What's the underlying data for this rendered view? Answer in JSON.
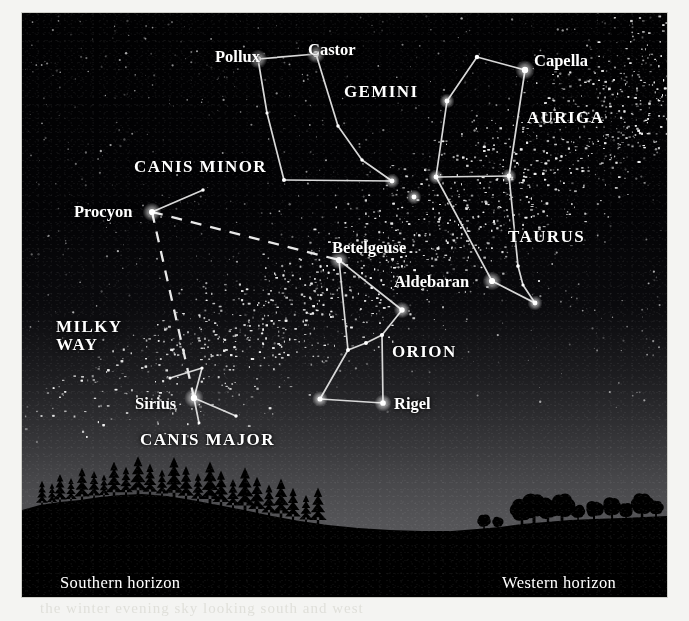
{
  "plate": {
    "width": 645,
    "height": 584,
    "sky_color_zenith": "#010102",
    "sky_color_horizon": "#5c5c5f",
    "star_color": "#ffffff",
    "line_color": "#d8d8d8",
    "ground_color": "#000000"
  },
  "bleed_through_text": "the winter evening sky looking south and west",
  "labels": {
    "stars": [
      {
        "name": "Pollux",
        "text": "Pollux",
        "x": 193,
        "y": 35,
        "anchor": "start"
      },
      {
        "name": "Castor",
        "text": "Castor",
        "x": 286,
        "y": 28,
        "anchor": "start"
      },
      {
        "name": "Capella",
        "text": "Capella",
        "x": 512,
        "y": 39,
        "anchor": "start"
      },
      {
        "name": "Procyon",
        "text": "Procyon",
        "x": 52,
        "y": 190,
        "anchor": "start"
      },
      {
        "name": "Betelgeuse",
        "text": "Betelgeuse",
        "x": 310,
        "y": 226,
        "anchor": "start"
      },
      {
        "name": "Aldebaran",
        "text": "Aldebaran",
        "x": 372,
        "y": 260,
        "anchor": "start"
      },
      {
        "name": "Rigel",
        "text": "Rigel",
        "x": 372,
        "y": 382,
        "anchor": "start"
      },
      {
        "name": "Sirius",
        "text": "Sirius",
        "x": 113,
        "y": 382,
        "anchor": "start"
      }
    ],
    "constellations": [
      {
        "name": "GEMINI",
        "text": "GEMINI",
        "x": 322,
        "y": 70,
        "lines": [
          "GEMINI"
        ]
      },
      {
        "name": "AURIGA",
        "text": "AURIGA",
        "x": 505,
        "y": 96,
        "lines": [
          "AURIGA"
        ]
      },
      {
        "name": "CANIS MINOR",
        "text": "CANIS MINOR",
        "x": 112,
        "y": 145,
        "lines": [
          "CANIS MINOR"
        ]
      },
      {
        "name": "TAURUS",
        "text": "TAURUS",
        "x": 486,
        "y": 215,
        "lines": [
          "TAURUS"
        ]
      },
      {
        "name": "ORION",
        "text": "ORION",
        "x": 370,
        "y": 330,
        "lines": [
          "ORION"
        ]
      },
      {
        "name": "CANIS MAJOR",
        "text": "CANIS MAJOR",
        "x": 118,
        "y": 418,
        "lines": [
          "CANIS MAJOR"
        ]
      },
      {
        "name": "MILKY WAY",
        "text": "MILKY\nWAY",
        "x": 34,
        "y": 305,
        "lines": [
          "MILKY",
          "WAY"
        ]
      }
    ],
    "horizons": [
      {
        "name": "southern-horizon",
        "text": "Southern horizon",
        "x": 38,
        "y": 561
      },
      {
        "name": "western-horizon",
        "text": "Western horizon",
        "x": 480,
        "y": 561
      }
    ]
  },
  "chart_data": {
    "type": "scatter",
    "coordinate_space": {
      "width": 645,
      "height": 584,
      "note": "plate pixel coordinates"
    },
    "constellations": [
      {
        "name": "GEMINI",
        "stars": [
          {
            "id": "pollux",
            "label": "Pollux",
            "x": 236,
            "y": 46,
            "mag_r": 5.0
          },
          {
            "id": "castor",
            "label": "Castor",
            "x": 294,
            "y": 41,
            "mag_r": 5.0
          },
          {
            "id": "gem-a",
            "label": "",
            "x": 245,
            "y": 100,
            "mag_r": 2.6
          },
          {
            "id": "gem-b",
            "label": "",
            "x": 262,
            "y": 167,
            "mag_r": 3.3
          },
          {
            "id": "gem-c",
            "label": "",
            "x": 316,
            "y": 113,
            "mag_r": 2.8
          },
          {
            "id": "gem-d",
            "label": "",
            "x": 340,
            "y": 147,
            "mag_r": 2.8
          },
          {
            "id": "gem-e",
            "label": "",
            "x": 370,
            "y": 168,
            "mag_r": 4.0
          }
        ],
        "lines": [
          [
            "pollux",
            "castor"
          ],
          [
            "pollux",
            "gem-a"
          ],
          [
            "gem-a",
            "gem-b"
          ],
          [
            "gem-b",
            "gem-e"
          ],
          [
            "castor",
            "gem-c"
          ],
          [
            "gem-c",
            "gem-d"
          ],
          [
            "gem-d",
            "gem-e"
          ]
        ]
      },
      {
        "name": "AURIGA",
        "stars": [
          {
            "id": "aur-top",
            "label": "",
            "x": 455,
            "y": 44,
            "mag_r": 3.6
          },
          {
            "id": "capella",
            "label": "Capella",
            "x": 503,
            "y": 57,
            "mag_r": 5.2
          },
          {
            "id": "aur-left",
            "label": "",
            "x": 425,
            "y": 88,
            "mag_r": 4.0
          },
          {
            "id": "aur-bl",
            "label": "",
            "x": 414,
            "y": 164,
            "mag_r": 4.0
          },
          {
            "id": "aur-br",
            "label": "",
            "x": 487,
            "y": 163,
            "mag_r": 4.0
          }
        ],
        "lines": [
          [
            "aur-top",
            "capella"
          ],
          [
            "aur-top",
            "aur-left"
          ],
          [
            "aur-left",
            "aur-bl"
          ],
          [
            "aur-bl",
            "aur-br"
          ],
          [
            "aur-br",
            "capella"
          ]
        ]
      },
      {
        "name": "TAURUS",
        "stars": [
          {
            "id": "tau-top",
            "label": "",
            "x": 392,
            "y": 184,
            "mag_r": 4.0
          },
          {
            "id": "aldebaran",
            "label": "Aldebaran",
            "x": 470,
            "y": 268,
            "mag_r": 5.0
          },
          {
            "id": "hya-a",
            "label": "",
            "x": 496,
            "y": 253,
            "mag_r": 3.0
          },
          {
            "id": "hya-b",
            "label": "",
            "x": 501,
            "y": 272,
            "mag_r": 2.6
          },
          {
            "id": "hya-c",
            "label": "",
            "x": 513,
            "y": 290,
            "mag_r": 4.0
          },
          {
            "id": "hya-d",
            "label": "",
            "x": 517,
            "y": 268,
            "mag_r": 1.8
          }
        ],
        "lines": [
          [
            "aur-bl",
            "aldebaran"
          ],
          [
            "aldebaran",
            "hya-c"
          ],
          [
            "aur-br",
            "hya-a"
          ],
          [
            "hya-a",
            "hya-b"
          ],
          [
            "hya-b",
            "hya-c"
          ]
        ]
      },
      {
        "name": "ORION",
        "stars": [
          {
            "id": "betelgeuse",
            "label": "Betelgeuse",
            "x": 317,
            "y": 247,
            "mag_r": 5.0
          },
          {
            "id": "bellatrix",
            "label": "",
            "x": 380,
            "y": 297,
            "mag_r": 4.4
          },
          {
            "id": "belt-1",
            "label": "",
            "x": 326,
            "y": 337,
            "mag_r": 3.2
          },
          {
            "id": "belt-2",
            "label": "",
            "x": 344,
            "y": 330,
            "mag_r": 3.2
          },
          {
            "id": "belt-3",
            "label": "",
            "x": 360,
            "y": 322,
            "mag_r": 3.4
          },
          {
            "id": "rigel",
            "label": "Rigel",
            "x": 361,
            "y": 390,
            "mag_r": 4.6
          },
          {
            "id": "saiph",
            "label": "",
            "x": 298,
            "y": 386,
            "mag_r": 4.2
          }
        ],
        "lines": [
          [
            "betelgeuse",
            "bellatrix"
          ],
          [
            "betelgeuse",
            "belt-1"
          ],
          [
            "bellatrix",
            "belt-3"
          ],
          [
            "belt-3",
            "belt-2"
          ],
          [
            "belt-2",
            "belt-1"
          ],
          [
            "belt-3",
            "rigel"
          ],
          [
            "belt-1",
            "saiph"
          ],
          [
            "saiph",
            "rigel"
          ]
        ]
      },
      {
        "name": "CANIS MINOR",
        "stars": [
          {
            "id": "procyon",
            "label": "Procyon",
            "x": 130,
            "y": 199,
            "mag_r": 5.0
          },
          {
            "id": "gomeisa",
            "label": "",
            "x": 181,
            "y": 177,
            "mag_r": 2.8
          }
        ],
        "lines": [
          [
            "procyon",
            "gomeisa"
          ]
        ]
      },
      {
        "name": "CANIS MAJOR",
        "stars": [
          {
            "id": "sirius",
            "label": "Sirius",
            "x": 172,
            "y": 385,
            "mag_r": 5.2
          },
          {
            "id": "cma-n",
            "label": "",
            "x": 180,
            "y": 355,
            "mag_r": 2.6
          },
          {
            "id": "cma-w",
            "label": "",
            "x": 148,
            "y": 365,
            "mag_r": 2.6
          },
          {
            "id": "cma-s",
            "label": "",
            "x": 177,
            "y": 410,
            "mag_r": 2.4
          },
          {
            "id": "cma-e",
            "label": "",
            "x": 214,
            "y": 403,
            "mag_r": 2.8
          }
        ],
        "lines": [
          [
            "cma-w",
            "cma-n"
          ],
          [
            "cma-n",
            "sirius"
          ],
          [
            "sirius",
            "cma-s"
          ],
          [
            "sirius",
            "cma-e"
          ]
        ]
      }
    ],
    "asterism": {
      "name": "Winter Triangle",
      "style": "dashed",
      "vertices": [
        "procyon",
        "betelgeuse",
        "sirius"
      ],
      "segments": [
        [
          "procyon",
          "betelgeuse"
        ],
        [
          "procyon",
          "sirius"
        ]
      ]
    },
    "milky_way": {
      "label": "MILKY WAY",
      "description": "dense star-cloud band running from upper-right to lower-left across the plate"
    },
    "horizon_labels": [
      "Southern horizon",
      "Western horizon"
    ]
  }
}
